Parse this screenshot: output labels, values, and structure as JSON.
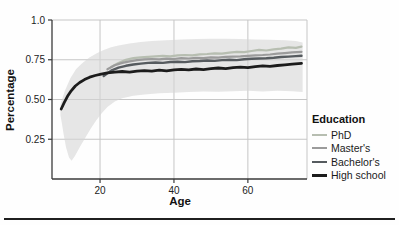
{
  "figure": {
    "bottom_rule_color": "#1f1f1f",
    "background": "#fefefe"
  },
  "chart_data": {
    "type": "line",
    "title": "",
    "xlabel": "Age",
    "ylabel": "Percentage",
    "xlim": [
      7,
      76
    ],
    "ylim": [
      0,
      1.0
    ],
    "grid": true,
    "grid_color": "#c6c6c6",
    "axis_color": "#3a3a3a",
    "tick_label_color": "#222222",
    "xticks": [
      {
        "v": 20,
        "label": "20"
      },
      {
        "v": 40,
        "label": "40"
      },
      {
        "v": 60,
        "label": "60"
      }
    ],
    "yticks": [
      {
        "v": 1.0,
        "label": "1.0"
      },
      {
        "v": 0.75,
        "label": "0.75"
      },
      {
        "v": 0.5,
        "label": "0.50"
      },
      {
        "v": 0.25,
        "label": "0.25"
      }
    ],
    "legend": {
      "title": "Education",
      "position": "right"
    },
    "band": {
      "name": "confidence-band",
      "color": "#d6d6d6",
      "opacity": 0.6,
      "polygon": [
        [
          9.3,
          0.4
        ],
        [
          9.3,
          0.47
        ],
        [
          10.5,
          0.555
        ],
        [
          12,
          0.635
        ],
        [
          13.5,
          0.69
        ],
        [
          15,
          0.725
        ],
        [
          17,
          0.762
        ],
        [
          19,
          0.79
        ],
        [
          21,
          0.812
        ],
        [
          23,
          0.828
        ],
        [
          25,
          0.84
        ],
        [
          28,
          0.853
        ],
        [
          31,
          0.862
        ],
        [
          34,
          0.868
        ],
        [
          38,
          0.873
        ],
        [
          42,
          0.877
        ],
        [
          46,
          0.88
        ],
        [
          50,
          0.882
        ],
        [
          54,
          0.882
        ],
        [
          58,
          0.88
        ],
        [
          62,
          0.878
        ],
        [
          66,
          0.876
        ],
        [
          70,
          0.873
        ],
        [
          73,
          0.868
        ],
        [
          74.8,
          0.858
        ],
        [
          74.8,
          0.548
        ],
        [
          72,
          0.552
        ],
        [
          68,
          0.555
        ],
        [
          64,
          0.551
        ],
        [
          60,
          0.555
        ],
        [
          56,
          0.552
        ],
        [
          52,
          0.549
        ],
        [
          48,
          0.551
        ],
        [
          44,
          0.547
        ],
        [
          40,
          0.543
        ],
        [
          36,
          0.539
        ],
        [
          32,
          0.532
        ],
        [
          29,
          0.524
        ],
        [
          26,
          0.508
        ],
        [
          24,
          0.487
        ],
        [
          22,
          0.452
        ],
        [
          20.5,
          0.415
        ],
        [
          19,
          0.37
        ],
        [
          17.5,
          0.318
        ],
        [
          16,
          0.26
        ],
        [
          14.5,
          0.2
        ],
        [
          13.2,
          0.145
        ],
        [
          12.3,
          0.115
        ],
        [
          11.6,
          0.135
        ],
        [
          10.8,
          0.2
        ],
        [
          10.2,
          0.275
        ],
        [
          9.7,
          0.345
        ]
      ]
    },
    "series": [
      {
        "name": "PhD",
        "color": "#b7beb1",
        "width": 2.2,
        "points": [
          [
            23,
            0.705
          ],
          [
            25,
            0.73
          ],
          [
            27,
            0.75
          ],
          [
            29,
            0.76
          ],
          [
            31,
            0.765
          ],
          [
            33,
            0.768
          ],
          [
            35,
            0.772
          ],
          [
            37,
            0.775
          ],
          [
            39,
            0.772
          ],
          [
            41,
            0.778
          ],
          [
            43,
            0.78
          ],
          [
            45,
            0.778
          ],
          [
            47,
            0.784
          ],
          [
            49,
            0.786
          ],
          [
            51,
            0.79
          ],
          [
            53,
            0.788
          ],
          [
            55,
            0.795
          ],
          [
            57,
            0.8
          ],
          [
            59,
            0.798
          ],
          [
            61,
            0.805
          ],
          [
            63,
            0.812
          ],
          [
            65,
            0.808
          ],
          [
            67,
            0.815
          ],
          [
            69,
            0.82
          ],
          [
            71,
            0.828
          ],
          [
            73,
            0.825
          ],
          [
            74.5,
            0.832
          ]
        ]
      },
      {
        "name": "Master's",
        "color": "#9b9b9b",
        "width": 2.2,
        "points": [
          [
            22,
            0.69
          ],
          [
            24,
            0.715
          ],
          [
            26,
            0.73
          ],
          [
            28,
            0.74
          ],
          [
            30,
            0.748
          ],
          [
            32,
            0.752
          ],
          [
            34,
            0.755
          ],
          [
            36,
            0.752
          ],
          [
            38,
            0.757
          ],
          [
            40,
            0.755
          ],
          [
            42,
            0.76
          ],
          [
            44,
            0.758
          ],
          [
            46,
            0.762
          ],
          [
            48,
            0.76
          ],
          [
            50,
            0.765
          ],
          [
            52,
            0.763
          ],
          [
            54,
            0.768
          ],
          [
            56,
            0.77
          ],
          [
            58,
            0.772
          ],
          [
            60,
            0.775
          ],
          [
            62,
            0.778
          ],
          [
            64,
            0.78
          ],
          [
            66,
            0.783
          ],
          [
            68,
            0.788
          ],
          [
            70,
            0.792
          ],
          [
            72,
            0.796
          ],
          [
            74.5,
            0.8
          ]
        ]
      },
      {
        "name": "Bachelor's",
        "color": "#565b5f",
        "width": 2.4,
        "points": [
          [
            21,
            0.648
          ],
          [
            23,
            0.682
          ],
          [
            25,
            0.7
          ],
          [
            27,
            0.712
          ],
          [
            29,
            0.72
          ],
          [
            31,
            0.726
          ],
          [
            33,
            0.73
          ],
          [
            35,
            0.733
          ],
          [
            37,
            0.73
          ],
          [
            39,
            0.736
          ],
          [
            41,
            0.738
          ],
          [
            43,
            0.735
          ],
          [
            45,
            0.74
          ],
          [
            47,
            0.742
          ],
          [
            49,
            0.745
          ],
          [
            51,
            0.743
          ],
          [
            53,
            0.748
          ],
          [
            55,
            0.75
          ],
          [
            57,
            0.748
          ],
          [
            59,
            0.753
          ],
          [
            61,
            0.756
          ],
          [
            63,
            0.758
          ],
          [
            65,
            0.76
          ],
          [
            67,
            0.763
          ],
          [
            69,
            0.767
          ],
          [
            71,
            0.77
          ],
          [
            73,
            0.773
          ],
          [
            74.5,
            0.775
          ]
        ]
      },
      {
        "name": "High school",
        "color": "#1c1c1c",
        "width": 2.8,
        "points": [
          [
            9.5,
            0.44
          ],
          [
            10.3,
            0.48
          ],
          [
            11.2,
            0.52
          ],
          [
            12.2,
            0.555
          ],
          [
            13.3,
            0.585
          ],
          [
            14.5,
            0.607
          ],
          [
            15.8,
            0.625
          ],
          [
            17.2,
            0.64
          ],
          [
            18.7,
            0.651
          ],
          [
            20.3,
            0.66
          ],
          [
            22,
            0.667
          ],
          [
            24,
            0.672
          ],
          [
            26,
            0.676
          ],
          [
            28,
            0.672
          ],
          [
            30,
            0.678
          ],
          [
            32,
            0.682
          ],
          [
            34,
            0.678
          ],
          [
            36,
            0.684
          ],
          [
            38,
            0.68
          ],
          [
            40,
            0.686
          ],
          [
            42,
            0.69
          ],
          [
            44,
            0.686
          ],
          [
            46,
            0.692
          ],
          [
            48,
            0.688
          ],
          [
            50,
            0.694
          ],
          [
            52,
            0.698
          ],
          [
            54,
            0.694
          ],
          [
            56,
            0.7
          ],
          [
            58,
            0.704
          ],
          [
            60,
            0.7
          ],
          [
            62,
            0.707
          ],
          [
            64,
            0.712
          ],
          [
            66,
            0.708
          ],
          [
            68,
            0.714
          ],
          [
            70,
            0.718
          ],
          [
            72,
            0.722
          ],
          [
            74.5,
            0.727
          ]
        ]
      }
    ]
  }
}
